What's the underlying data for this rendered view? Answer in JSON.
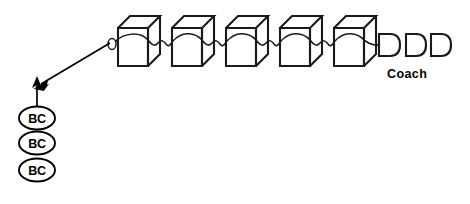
{
  "figure": {
    "title": "",
    "background_color": "#ffffff",
    "line_color": "#1a1a1a",
    "accent_color": "#000000"
  },
  "train": {
    "cars": [
      {
        "id": "car-1",
        "x": 118,
        "y": 16,
        "width": 30,
        "height": 50,
        "depth": 12
      },
      {
        "id": "car-2",
        "x": 172,
        "y": 16,
        "width": 30,
        "height": 50,
        "depth": 12
      },
      {
        "id": "car-3",
        "x": 226,
        "y": 16,
        "width": 30,
        "height": 50,
        "depth": 12
      },
      {
        "id": "car-4",
        "x": 280,
        "y": 16,
        "width": 30,
        "height": 50,
        "depth": 12
      },
      {
        "id": "car-5",
        "x": 334,
        "y": 16,
        "width": 30,
        "height": 50,
        "depth": 12
      }
    ],
    "coaches": [
      {
        "id": "coach-1",
        "x": 378,
        "y": 34,
        "width": 22,
        "height": 22
      },
      {
        "id": "coach-2",
        "x": 406,
        "y": 34,
        "width": 20,
        "height": 22
      },
      {
        "id": "coach-3",
        "x": 431,
        "y": 34,
        "width": 20,
        "height": 22
      }
    ],
    "coach_label": "Coach",
    "coupling_loop": {
      "cx": 112,
      "cy": 44,
      "rx": 4,
      "ry": 5.5
    }
  },
  "annotations": {
    "pointer_arrow": {
      "from_x": 112,
      "from_y": 43,
      "to_x": 36,
      "to_y": 88
    },
    "vertical_arrow": {
      "from_x": 37,
      "from_y": 110,
      "to_x": 37,
      "to_y": 79
    },
    "badges": [
      {
        "label": "BC",
        "cx": 37,
        "cy": 118
      },
      {
        "label": "BC",
        "cx": 37,
        "cy": 143
      },
      {
        "label": "BC",
        "cx": 37,
        "cy": 170
      }
    ]
  }
}
